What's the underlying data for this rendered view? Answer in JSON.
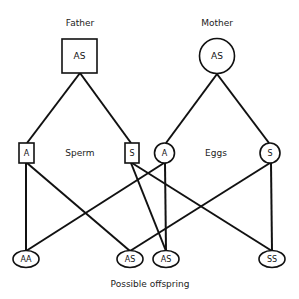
{
  "parents": {
    "father": {
      "label": "Father",
      "genotype": "AS",
      "shape": "square"
    },
    "mother": {
      "label": "Mother",
      "genotype": "AS",
      "shape": "circle"
    }
  },
  "gametes": {
    "sperm_label": "Sperm",
    "eggs_label": "Eggs",
    "sperm": [
      {
        "allele": "A",
        "shape": "square"
      },
      {
        "allele": "S",
        "shape": "square"
      }
    ],
    "eggs": [
      {
        "allele": "A",
        "shape": "circle"
      },
      {
        "allele": "S",
        "shape": "circle"
      }
    ]
  },
  "offspring": {
    "label": "Possible offspring",
    "items": [
      {
        "genotype": "AA"
      },
      {
        "genotype": "AS"
      },
      {
        "genotype": "AS"
      },
      {
        "genotype": "SS"
      }
    ]
  },
  "connections": [
    {
      "from": "father",
      "to": "sperm.0"
    },
    {
      "from": "father",
      "to": "sperm.1"
    },
    {
      "from": "mother",
      "to": "eggs.0"
    },
    {
      "from": "mother",
      "to": "eggs.1"
    },
    {
      "from": "sperm.0",
      "to": "offspring.0"
    },
    {
      "from": "sperm.0",
      "to": "offspring.1"
    },
    {
      "from": "sperm.1",
      "to": "offspring.2"
    },
    {
      "from": "sperm.1",
      "to": "offspring.3"
    },
    {
      "from": "eggs.0",
      "to": "offspring.0"
    },
    {
      "from": "eggs.0",
      "to": "offspring.2"
    },
    {
      "from": "eggs.1",
      "to": "offspring.1"
    },
    {
      "from": "eggs.1",
      "to": "offspring.3"
    }
  ]
}
